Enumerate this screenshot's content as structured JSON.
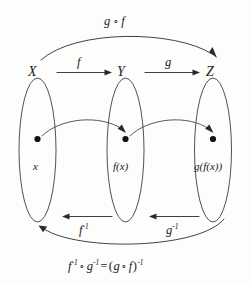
{
  "diagram": {
    "background_color": "#fdfdfc",
    "ink_color": "#2b2b2b",
    "sets": [
      {
        "id": "X",
        "label": "X",
        "element_label": "x"
      },
      {
        "id": "Y",
        "label": "Y",
        "element_label": "f(x)"
      },
      {
        "id": "Z",
        "label": "Z",
        "element_label": "g(f(x))"
      }
    ],
    "forward_maps": [
      {
        "id": "f",
        "label": "f",
        "from": "X",
        "to": "Y"
      },
      {
        "id": "g",
        "label": "g",
        "from": "Y",
        "to": "Z"
      }
    ],
    "inverse_maps": [
      {
        "id": "f-inverse",
        "base": "f",
        "exponent": "-1",
        "from": "Y",
        "to": "X"
      },
      {
        "id": "g-inverse",
        "base": "g",
        "exponent": "-1",
        "from": "Z",
        "to": "Y"
      }
    ],
    "composition": {
      "id": "g-after-f",
      "left": "g",
      "operator": "∘",
      "right": "f",
      "from": "X",
      "to": "Z"
    },
    "inverse_composition_formula": {
      "id": "inverse-composition",
      "lhs_first_base": "f",
      "lhs_first_exponent": "-1",
      "operator": "∘",
      "lhs_second_base": "g",
      "lhs_second_exponent": "-1",
      "equals": "=",
      "rhs_open": "(",
      "rhs_first": "g",
      "rhs_second": "f",
      "rhs_close": ")",
      "rhs_exponent": "-1"
    }
  }
}
